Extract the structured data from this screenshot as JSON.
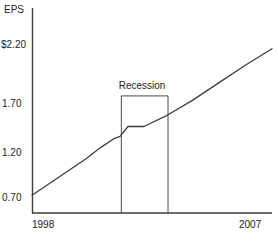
{
  "chart_data": {
    "type": "line",
    "title": "",
    "subtitle": "",
    "xlabel": "",
    "ylabel": "EPS",
    "ylabel_display": "EPS",
    "grid": false,
    "legend_position": "none",
    "xlim": [
      1998,
      2007
    ],
    "ylim": [
      0.7,
      2.35
    ],
    "y_ticks": [
      0.7,
      1.2,
      1.7,
      2.2
    ],
    "y_tick_labels": [
      "0.70",
      "1.20",
      "1.70",
      "$2.20"
    ],
    "x_ticks": [
      1998,
      2007
    ],
    "x_tick_labels": [
      "1998",
      "2007"
    ],
    "series": [
      {
        "name": "EPS",
        "x": [
          1998.0,
          1999.0,
          2000.0,
          2000.6,
          2001.1,
          2001.3,
          2001.6,
          2002.2,
          2003.1,
          2004.0,
          2005.0,
          2006.0,
          2007.0
        ],
        "values": [
          0.72,
          0.92,
          1.12,
          1.25,
          1.34,
          1.36,
          1.46,
          1.46,
          1.58,
          1.72,
          1.87,
          2.02,
          2.16
        ]
      }
    ],
    "annotations": [
      {
        "name": "recession-band",
        "label": "Recession",
        "type": "box",
        "x_start": 2001.35,
        "x_end": 2003.1,
        "y_top": 1.76,
        "y_bottom": 0.55
      }
    ]
  },
  "axis": {
    "y_axis_title": "EPS",
    "y_tick_labels": [
      "$2.20",
      "1.70",
      "1.20",
      "0.70"
    ],
    "x_tick_labels": [
      "1998",
      "2007"
    ]
  },
  "annotation": {
    "recession_label": "Recession"
  },
  "colors": {
    "line": "#3d3d3d",
    "axis": "#3d3d3d",
    "box": "#4a4a4a",
    "text": "#222222",
    "background": "#ffffff"
  }
}
